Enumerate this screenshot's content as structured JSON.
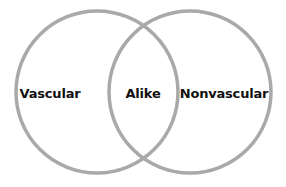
{
  "diagram": {
    "type": "venn",
    "circle_color": "#a9a9a9",
    "background": "#ffffff",
    "text_color": "#111111",
    "sets": [
      {
        "id": "left",
        "label": "Vascular"
      },
      {
        "id": "right",
        "label": "Nonvascular"
      }
    ],
    "intersection": {
      "label": "Alike"
    }
  }
}
